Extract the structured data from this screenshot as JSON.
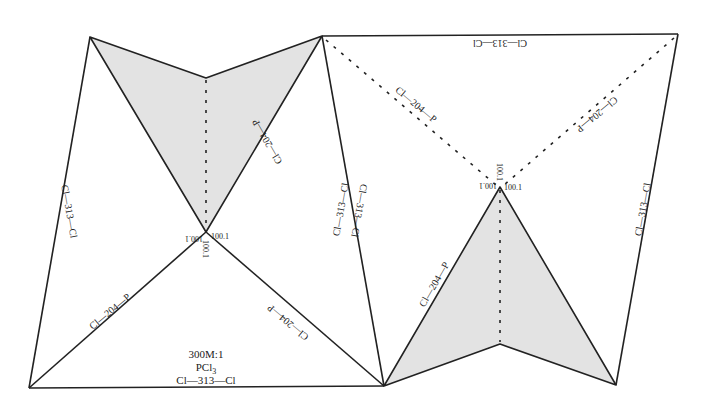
{
  "diagram": {
    "title_lines": [
      "300M:1",
      "PCl",
      "Cl—313—Cl"
    ],
    "formula_subscript": "3",
    "shade_color": "#e3e3e3",
    "line_color": "#222222",
    "labels": {
      "left_outer_edge": "Cl—313—Cl",
      "left_shade_edge": "Cl—204—P",
      "left_lower_left": "Cl—204—P",
      "left_lower_right": "Cl—204—P",
      "mid_edge_a": "Cl—313—Cl",
      "mid_edge_b": "Cl—313—Cl",
      "right_top_edge": "Cl—313—Cl",
      "right_dotted_left": "Cl—204—P",
      "right_dotted_right": "Cl—204—P",
      "right_shade_edge": "Cl—204—P",
      "right_outer_edge": "Cl—313—Cl",
      "left_angle_a": "100.1",
      "left_angle_b": "100.1",
      "left_angle_c": "100.1",
      "right_angle_a": "100.1",
      "right_angle_b": "100.1",
      "right_angle_c": "100.1"
    }
  }
}
